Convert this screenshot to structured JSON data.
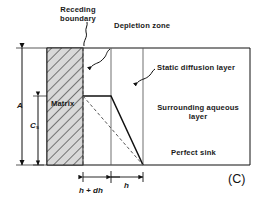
{
  "figure": {
    "panel_label": "(C)",
    "labels": {
      "receding_boundary_line1": "Receding",
      "receding_boundary_line2": "boundary",
      "depletion_zone": "Depletion zone",
      "static_diffusion_layer": "Static diffusion layer",
      "matrix": "Matrix",
      "surrounding_aqueous_line1": "Surrounding aqueous",
      "surrounding_aqueous_line2": "layer",
      "perfect_sink": "Perfect sink"
    },
    "dimensions": {
      "total_height": "A",
      "concentration_symbol": "C",
      "concentration_subscript": "s",
      "matrix_depth": "h + dh",
      "diffusion_thickness": "h"
    },
    "colors": {
      "background": "#ffffff",
      "line": "#111111",
      "hatch_fill": "#d9d9d9",
      "hatch_stroke": "#3a3a3a"
    }
  }
}
